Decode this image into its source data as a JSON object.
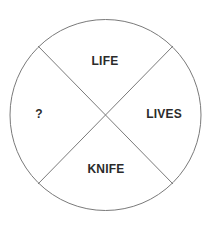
{
  "diagram": {
    "type": "circle-divided-into-four-sectors",
    "line_color": "#7a7a7a",
    "text_color": "#2b2b2b",
    "sectors": {
      "top": "LIFE",
      "right": "LIVES",
      "bottom": "KNIFE",
      "left": "?"
    }
  }
}
